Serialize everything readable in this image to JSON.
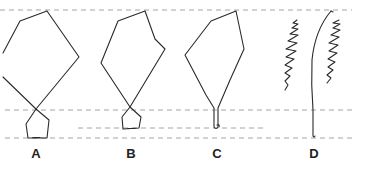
{
  "figure": {
    "panels": [
      {
        "id": "A",
        "label": "A",
        "description": "Large kite loop crossing into small pentagon loop"
      },
      {
        "id": "B",
        "label": "B",
        "description": "Medium kite loop crossing into small pentagon loop"
      },
      {
        "id": "C",
        "label": "C",
        "description": "Kite loop narrowing into a closed stem"
      },
      {
        "id": "D",
        "label": "D",
        "description": "Single curved stem flanked by two zigzag lines"
      }
    ],
    "guide_lines": [
      {
        "name": "top",
        "y": 10
      },
      {
        "name": "middle",
        "y": 110
      },
      {
        "name": "lower-short",
        "y": 128
      },
      {
        "name": "bottom",
        "y": 138
      }
    ],
    "colors": {
      "stroke": "#2a2a2a",
      "guide": "#9a9a9a",
      "background": "#ffffff"
    }
  }
}
